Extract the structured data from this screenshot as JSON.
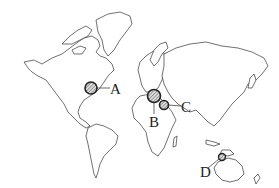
{
  "map": {
    "type": "world outline map",
    "markers": [
      {
        "id": "A",
        "label": "A",
        "cx": 91,
        "cy": 88,
        "r": 6,
        "label_x": 110,
        "label_y": 82,
        "region": "eastern North America"
      },
      {
        "id": "B",
        "label": "B",
        "cx": 154,
        "cy": 96,
        "r": 6.5,
        "label_x": 149,
        "label_y": 115,
        "region": "Mediterranean / southern Europe"
      },
      {
        "id": "C",
        "label": "C",
        "cx": 164,
        "cy": 105,
        "r": 4.5,
        "label_x": 181,
        "label_y": 100,
        "region": "Middle East"
      },
      {
        "id": "D",
        "label": "D",
        "cx": 222,
        "cy": 157,
        "r": 3.5,
        "label_x": 200,
        "label_y": 165,
        "region": "New Guinea / Indonesia"
      }
    ],
    "colors": {
      "outline": "#333333",
      "marker_stroke": "#222222",
      "hatch": "#555555",
      "background": "#ffffff"
    }
  }
}
